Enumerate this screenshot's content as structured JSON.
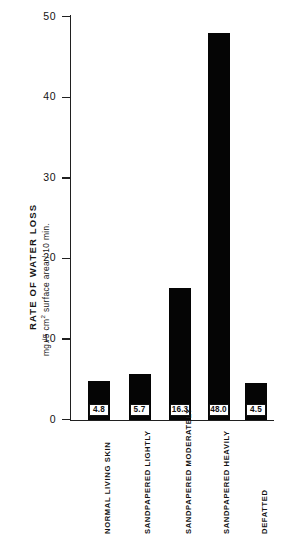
{
  "chart_data": {
    "type": "bar",
    "title": "",
    "subtitle": "",
    "xlabel": "",
    "ylabel": "RATE OF WATER LOSS",
    "ylabel_units": "mg./5 cm² surface area / 10 min.",
    "ylim": [
      0,
      50
    ],
    "ytick_labels": [
      "0",
      "10",
      "20",
      "30",
      "40",
      "50"
    ],
    "ytick_values": [
      0,
      10,
      20,
      30,
      40,
      50
    ],
    "grid": false,
    "legend": false,
    "legend_position": "none",
    "bar_color": "#050505",
    "axis_color": "#202020",
    "categories": [
      "NORMAL LIVING SKIN",
      "SANDPAPERED LIGHTLY",
      "SANDPAPERED MODERATELY",
      "SANDPAPERED HEAVILY",
      "DEFATTED"
    ],
    "values": [
      4.8,
      5.7,
      16.3,
      48.0,
      4.5
    ],
    "value_labels": [
      "4.8",
      "5.7",
      "16.3",
      "48.0",
      "4.5"
    ]
  },
  "yaxis": {
    "title_line1": "RATE OF WATER LOSS",
    "title_line2_prefix": "mg./5 cm",
    "title_line2_sup": "2",
    "title_line2_suffix": " surface area / 10 min."
  }
}
